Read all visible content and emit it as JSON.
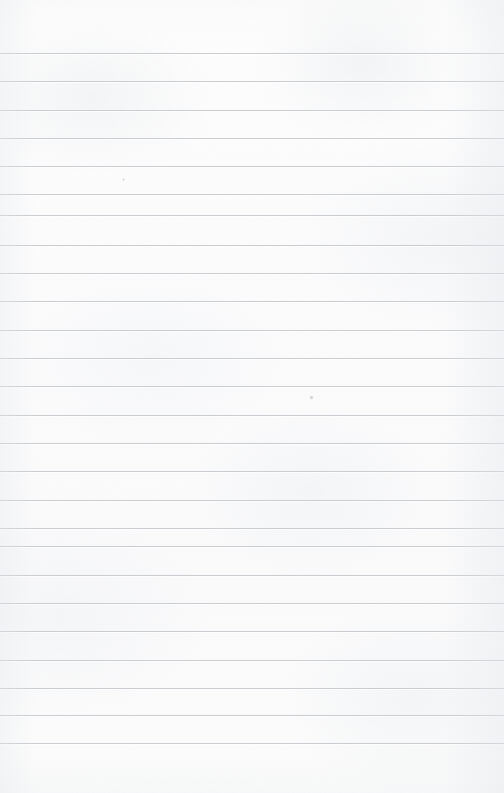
{
  "page": {
    "kind": "blank-lined-paper",
    "width": 504,
    "height": 793,
    "paper_color": "#fcfcfc",
    "rule_color": "#c9ccd1",
    "text_content": "",
    "note": ""
  },
  "rules": {
    "count": 25,
    "first_line_y": 53,
    "spacing": 28.3,
    "thickness": 1,
    "left_margin": 0,
    "right_margin": 0,
    "positions": [
      53,
      81,
      110,
      138,
      166,
      194,
      215,
      245,
      273,
      301,
      330,
      358,
      386,
      415,
      443,
      471,
      500,
      528,
      546,
      575,
      603,
      631,
      660,
      688,
      715,
      743
    ]
  },
  "marks": [
    {
      "name": "paper-speck",
      "x": 311,
      "y": 397,
      "size": 5
    },
    {
      "name": "paper-speck",
      "x": 123,
      "y": 179,
      "size": 3
    }
  ]
}
